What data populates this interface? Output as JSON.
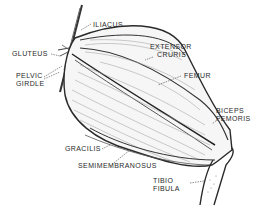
{
  "diagram": {
    "type": "anatomical-illustration",
    "labels": [
      {
        "id": "iliacus",
        "lines": [
          "ILIACUS"
        ]
      },
      {
        "id": "gluteus",
        "lines": [
          "GLUTEUS"
        ]
      },
      {
        "id": "pelvic-girdle",
        "lines": [
          "PELVIC",
          "GIRDLE"
        ]
      },
      {
        "id": "extensor-cruris",
        "lines": [
          "EXTENSOR",
          "CRURIS"
        ]
      },
      {
        "id": "femur",
        "lines": [
          "FEMUR"
        ]
      },
      {
        "id": "biceps-femoris",
        "lines": [
          "BICEPS",
          "FEMORIS"
        ]
      },
      {
        "id": "gracilis",
        "lines": [
          "GRACILIS"
        ]
      },
      {
        "id": "semimembranosus",
        "lines": [
          "SEMIMEMBRANOSUS"
        ]
      },
      {
        "id": "tibio-fibula",
        "lines": [
          "TIBIO",
          "FIBULA"
        ]
      }
    ],
    "colors": {
      "ink": "#2a2a2a",
      "background": "#ffffff"
    }
  }
}
